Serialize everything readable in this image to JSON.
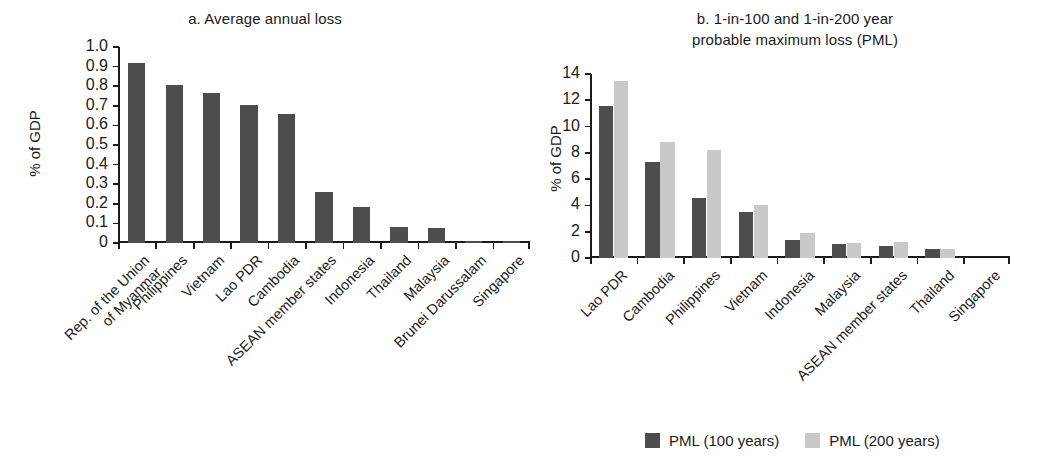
{
  "figure": {
    "colors": {
      "dark": "#4d4d4d",
      "light": "#c9c9c9",
      "axis": "#1a1a1a"
    }
  },
  "legend": {
    "items": [
      {
        "label": "PML (100 years)",
        "color": "#4d4d4d"
      },
      {
        "label": "PML (200 years)",
        "color": "#c9c9c9"
      }
    ]
  },
  "chart_data": [
    {
      "type": "bar",
      "panel": "a",
      "title": "a. Average annual loss",
      "xlabel": "",
      "ylabel": "% of GDP",
      "ylim": [
        0,
        1.0
      ],
      "ytick_labels": [
        "1.0",
        "0.9",
        "0.8",
        "0.7",
        "0.6",
        "0.5",
        "0.4",
        "0.3",
        "0.2",
        "0.1",
        "0"
      ],
      "yticks": [
        1.0,
        0.9,
        0.8,
        0.7,
        0.6,
        0.5,
        0.4,
        0.3,
        0.2,
        0.1,
        0
      ],
      "grid": false,
      "legend_position": "none",
      "categories": [
        "Rep. of the Union\nof Myanmar",
        "Philippines",
        "Vietnam",
        "Lao PDR",
        "Cambodia",
        "ASEAN member states",
        "Indonesia",
        "Thailand",
        "Malaysia",
        "Brunei Darussalam",
        "Singapore"
      ],
      "values": [
        0.92,
        0.805,
        0.765,
        0.705,
        0.66,
        0.26,
        0.185,
        0.08,
        0.077,
        0.01,
        0.01
      ],
      "series": [
        {
          "name": "Average annual loss",
          "color": "#4d4d4d",
          "values": [
            0.92,
            0.805,
            0.765,
            0.705,
            0.66,
            0.26,
            0.185,
            0.08,
            0.077,
            0.01,
            0.01
          ]
        }
      ]
    },
    {
      "type": "bar",
      "panel": "b",
      "title": "b. 1-in-100 and 1-in-200 year\nprobable maximum loss (PML)",
      "title_line1": "b. 1-in-100 and 1-in-200 year",
      "title_line2": "probable maximum loss (PML)",
      "xlabel": "",
      "ylabel": "% of GDP",
      "ylim": [
        0,
        14
      ],
      "ytick_labels": [
        "14",
        "12",
        "10",
        "8",
        "6",
        "4",
        "2",
        "0"
      ],
      "yticks": [
        14,
        12,
        10,
        8,
        6,
        4,
        2,
        0
      ],
      "grid": false,
      "legend_position": "bottom",
      "categories": [
        "Lao PDR",
        "Cambodia",
        "Philippines",
        "Vietnam",
        "Indonesia",
        "Malaysia",
        "ASEAN member states",
        "Thailand",
        "Singapore"
      ],
      "series": [
        {
          "name": "PML (100 years)",
          "color": "#4d4d4d",
          "values": [
            11.6,
            7.3,
            4.6,
            3.5,
            1.4,
            1.05,
            0.9,
            0.65,
            0
          ]
        },
        {
          "name": "PML (200 years)",
          "color": "#c9c9c9",
          "values": [
            13.5,
            8.8,
            8.2,
            4.0,
            1.9,
            1.15,
            1.25,
            0.7,
            0
          ]
        }
      ]
    }
  ]
}
